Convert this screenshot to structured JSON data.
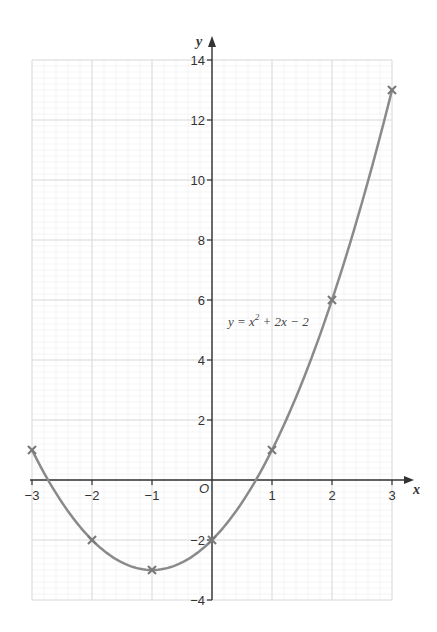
{
  "chart_data": {
    "type": "line",
    "title": "",
    "xlabel": "x",
    "ylabel": "y",
    "xlim": [
      -3,
      3
    ],
    "ylim": [
      -4,
      14
    ],
    "grid": true,
    "x_ticks": [
      -3,
      -2,
      -1,
      0,
      1,
      2,
      3
    ],
    "x_tick_labels": [
      "−3",
      "−2",
      "−1",
      "O",
      "1",
      "2",
      "3"
    ],
    "y_ticks": [
      -4,
      -2,
      2,
      4,
      6,
      8,
      10,
      12,
      14
    ],
    "y_tick_labels": [
      "−4",
      "−2",
      "2",
      "4",
      "6",
      "8",
      "10",
      "12",
      "14"
    ],
    "series": [
      {
        "name": "y = x² + 2x − 2",
        "x": [
          -3,
          -2,
          -1,
          0,
          1,
          2,
          3
        ],
        "values": [
          1,
          -2,
          -3,
          -2,
          1,
          6,
          13
        ],
        "marker": "x",
        "color": "#8a8a8a"
      }
    ],
    "annotations": [
      {
        "text": "y = x² + 2x − 2",
        "x": 0.2,
        "y": 5.3
      }
    ]
  },
  "labels": {
    "x_axis": "x",
    "y_axis": "y",
    "origin": "O",
    "equation_prefix": "y = x",
    "equation_exp": "2",
    "equation_suffix": " + 2x − 2"
  },
  "colors": {
    "curve": "#8a8a8a",
    "axis": "#333333",
    "grid_major": "#dcdcdc",
    "grid_minor": "#eeeeee"
  }
}
